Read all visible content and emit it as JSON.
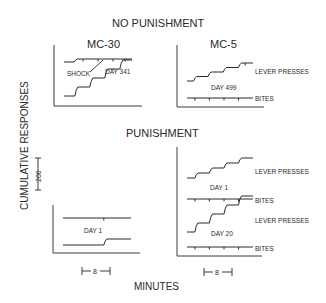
{
  "chart_data": {
    "type": "line",
    "ylabel": "CUMULATIVE RESPONSES",
    "xlabel": "MINUTES",
    "y_scale_bar": "200",
    "x_scale_bar": "8",
    "sections": {
      "no_punishment": "NO PUNISHMENT",
      "punishment": "PUNISHMENT"
    },
    "panels": [
      {
        "id": "mc30-nopun",
        "subject": "MC-30",
        "condition": "NO PUNISHMENT",
        "day_label": "DAY 341",
        "annotation": "SHOCK",
        "records": [
          {
            "name": "upper",
            "shape": "flat-with-ticks",
            "rise_steps": [
              0.15
            ],
            "ticks": [
              0.28,
              0.5,
              0.72,
              0.9
            ]
          },
          {
            "name": "lower",
            "shape": "steps",
            "rise_steps": [
              0.16,
              0.38,
              0.6,
              0.82
            ],
            "ticks": []
          }
        ]
      },
      {
        "id": "mc5-nopun",
        "subject": "MC-5",
        "condition": "NO PUNISHMENT",
        "day_label": "DAY 499",
        "records": [
          {
            "name": "LEVER PRESSES",
            "shape": "steps",
            "rise_steps": [
              0.1,
              0.32,
              0.55,
              0.78
            ],
            "ticks": [
              0.88
            ]
          },
          {
            "name": "BITES",
            "shape": "flat-with-ticks",
            "rise_steps": [],
            "ticks": [
              0.12,
              0.34,
              0.56,
              0.78
            ]
          }
        ]
      },
      {
        "id": "mc30-pun",
        "subject": "MC-30",
        "condition": "PUNISHMENT",
        "day_label": "DAY 1",
        "records": [
          {
            "name": "upper",
            "shape": "flat-with-ticks",
            "rise_steps": [],
            "ticks": [
              0.6
            ]
          },
          {
            "name": "lower",
            "shape": "steps",
            "rise_steps": [
              0.6
            ],
            "ticks": []
          }
        ]
      },
      {
        "id": "mc5-pun-day1",
        "subject": "MC-5",
        "condition": "PUNISHMENT",
        "day_label": "DAY 1",
        "records": [
          {
            "name": "LEVER PRESSES",
            "shape": "steps",
            "rise_steps": [
              0.12,
              0.34,
              0.56,
              0.78
            ],
            "ticks": []
          },
          {
            "name": "BITES",
            "shape": "flat-with-ticks",
            "rise_steps": [],
            "ticks": [
              0.12,
              0.34,
              0.56,
              0.78
            ]
          }
        ]
      },
      {
        "id": "mc5-pun-day20",
        "subject": "MC-5",
        "condition": "PUNISHMENT",
        "day_label": "DAY 20",
        "records": [
          {
            "name": "LEVER PRESSES",
            "shape": "steps",
            "rise_steps": [
              0.12,
              0.34,
              0.56,
              0.78
            ],
            "ticks": []
          },
          {
            "name": "BITES",
            "shape": "flat-with-ticks",
            "rise_steps": [],
            "ticks": [
              0.12,
              0.34,
              0.56,
              0.78
            ]
          }
        ]
      }
    ]
  }
}
